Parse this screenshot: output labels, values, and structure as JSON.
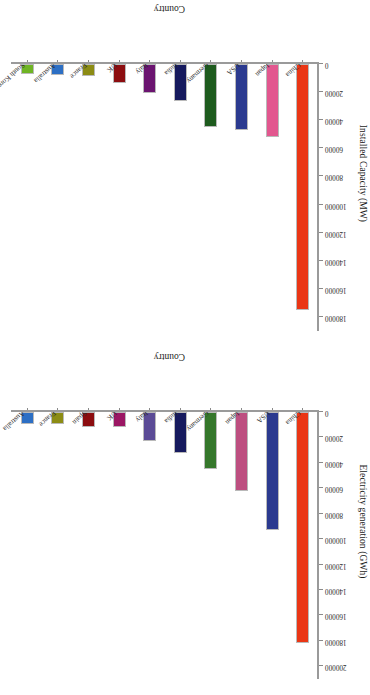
{
  "chart_data": [
    {
      "id": "installed-capacity",
      "type": "bar",
      "orientation": "vertical",
      "title": "",
      "xlabel": "Country",
      "ylabel": "Installed Capacity (MW)",
      "ylim": [
        0,
        190000
      ],
      "yticks": [
        0,
        20000,
        40000,
        60000,
        80000,
        100000,
        120000,
        140000,
        160000,
        180000
      ],
      "ytick_labels": [
        "0",
        "20000",
        "40000",
        "60000",
        "80000",
        "100000",
        "120000",
        "140000",
        "160000",
        "180000"
      ],
      "grid": false,
      "legend": "none",
      "categories": [
        "China",
        "Japan",
        "USA",
        "Germany",
        "India",
        "Italy",
        "UK",
        "France",
        "Australia",
        "South Korea"
      ],
      "values": [
        175000,
        52000,
        47000,
        44500,
        26000,
        21000,
        13500,
        8500,
        7500,
        7000
      ],
      "colors": [
        "#ea3615",
        "#e2578f",
        "#2b3a8f",
        "#1e5b1e",
        "#161a5e",
        "#6b1470",
        "#8c0d10",
        "#8c8c14",
        "#2d6fc4",
        "#6fb424"
      ]
    },
    {
      "id": "electricity-generation",
      "type": "bar",
      "orientation": "vertical",
      "title": "",
      "xlabel": "Country",
      "ylabel": "Electricity generation (GWh)",
      "ylim": [
        0,
        210000
      ],
      "yticks": [
        0,
        20000,
        40000,
        60000,
        80000,
        100000,
        120000,
        140000,
        160000,
        180000,
        200000
      ],
      "ytick_labels": [
        "0",
        "20000",
        "40000",
        "60000",
        "80000",
        "100000",
        "120000",
        "140000",
        "160000",
        "180000",
        "200000"
      ],
      "grid": false,
      "legend": "none",
      "categories": [
        "China",
        "USA",
        "Japan",
        "Germany",
        "India",
        "Italy",
        "UK",
        "Spain",
        "France",
        "Australia"
      ],
      "values": [
        182000,
        93000,
        62000,
        45000,
        32000,
        23000,
        12000,
        12000,
        9500,
        9500
      ],
      "colors": [
        "#ea3615",
        "#2b3a8f",
        "#bd4f80",
        "#35772b",
        "#161a5e",
        "#5b4b96",
        "#9b1764",
        "#8c0d10",
        "#8c8c14",
        "#2d6fc4"
      ]
    }
  ]
}
